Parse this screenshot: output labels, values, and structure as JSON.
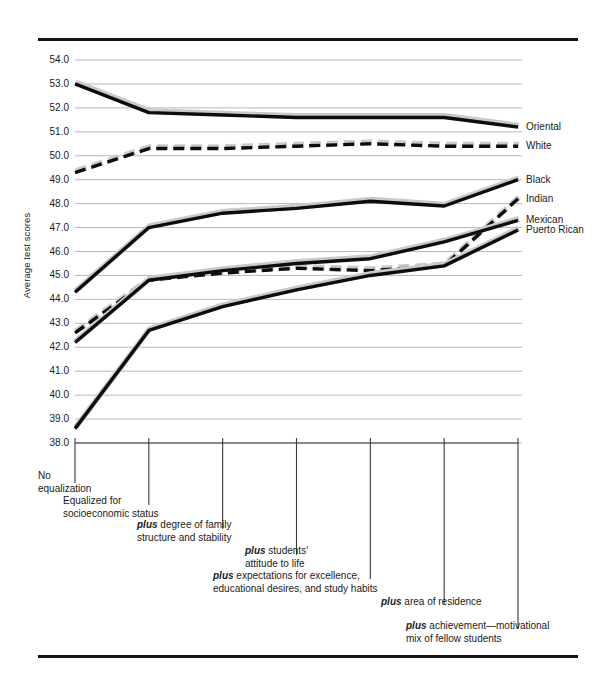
{
  "chart_data": {
    "type": "line",
    "title": "",
    "xlabel": "",
    "ylabel": "Average test scores",
    "ylim": [
      38.0,
      54.0
    ],
    "grid": true,
    "legend_position": "right-of-plot-end-labels",
    "ytick_labels": [
      "54.0",
      "53.0",
      "52.0",
      "51.0",
      "50.0",
      "49.0",
      "48.0",
      "47.0",
      "46.0",
      "45.0",
      "44.0",
      "43.0",
      "42.0",
      "41.0",
      "40.0",
      "39.0",
      "38.0"
    ],
    "ytick_values": [
      54.0,
      53.0,
      52.0,
      51.0,
      50.0,
      49.0,
      48.0,
      47.0,
      46.0,
      45.0,
      44.0,
      43.0,
      42.0,
      41.0,
      40.0,
      39.0,
      38.0
    ],
    "categories": [
      "No equalization",
      "Equalized for socioeconomic status",
      "plus degree of family structure and stability",
      "plus students' attitude to life",
      "plus expectations for excellence, educational desires, and study habits",
      "plus area of residence",
      "plus achievement—motivational mix of fellow students"
    ],
    "category_labels": [
      {
        "prefix": "",
        "text": "No\nequalization"
      },
      {
        "prefix": "",
        "text": "Equalized for\nsocioeconomic status"
      },
      {
        "prefix": "plus",
        "text": " degree of family\nstructure and stability"
      },
      {
        "prefix": "plus",
        "text": " students'\nattitude to life"
      },
      {
        "prefix": "plus",
        "text": " expectations for excellence,\neducational desires, and study habits"
      },
      {
        "prefix": "plus",
        "text": " area of residence"
      },
      {
        "prefix": "plus",
        "text": " achievement—motivational\nmix of fellow students"
      }
    ],
    "series": [
      {
        "name": "Oriental",
        "style": "solid",
        "values": [
          53.0,
          51.8,
          51.7,
          51.6,
          51.6,
          51.6,
          51.2
        ]
      },
      {
        "name": "White",
        "style": "dashed",
        "values": [
          49.3,
          50.3,
          50.3,
          50.4,
          50.5,
          50.4,
          50.4
        ]
      },
      {
        "name": "Black",
        "style": "solid",
        "values": [
          44.3,
          47.0,
          47.6,
          47.8,
          48.1,
          47.9,
          49.0
        ]
      },
      {
        "name": "Indian",
        "style": "dashed",
        "values": [
          42.6,
          44.8,
          45.1,
          45.3,
          45.2,
          45.4,
          48.2
        ]
      },
      {
        "name": "Mexican",
        "style": "solid",
        "values": [
          42.2,
          44.8,
          45.2,
          45.5,
          45.7,
          46.4,
          47.3
        ]
      },
      {
        "name": "Puerto Rican",
        "style": "solid",
        "values": [
          38.6,
          42.7,
          43.7,
          44.4,
          45.0,
          45.4,
          46.9
        ]
      }
    ]
  }
}
